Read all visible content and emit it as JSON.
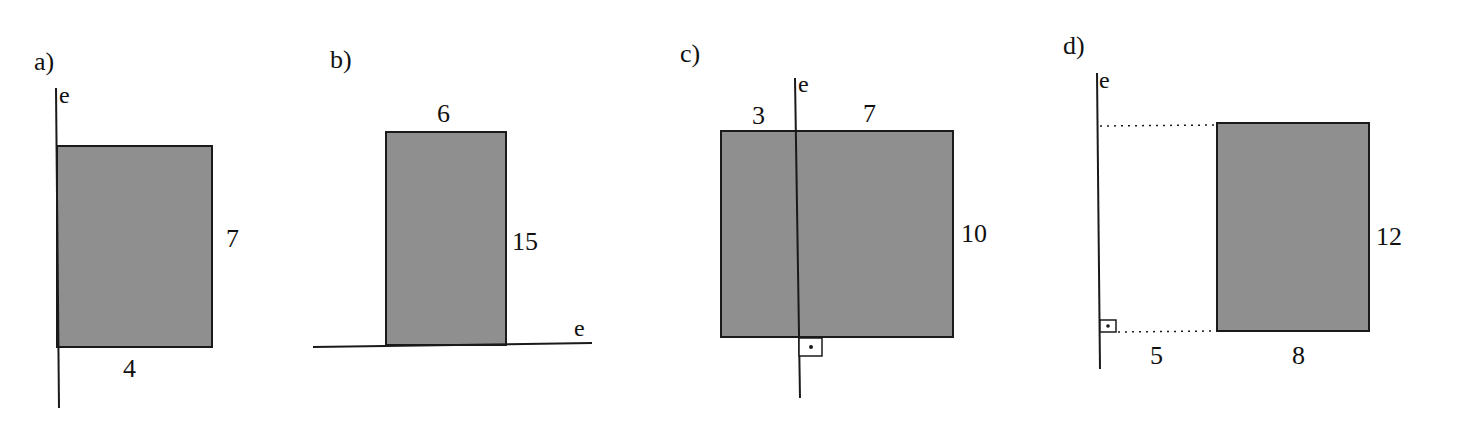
{
  "colors": {
    "fill": "#8f8f8f",
    "stroke": "#1a1a1a",
    "background": "#ffffff"
  },
  "figures": [
    {
      "id": "a",
      "label": "a)",
      "axis_label": "e",
      "width_label": "4",
      "height_label": "7"
    },
    {
      "id": "b",
      "label": "b)",
      "axis_label": "e",
      "width_label": "6",
      "height_label": "15"
    },
    {
      "id": "c",
      "label": "c)",
      "axis_label": "e",
      "left_width_label": "3",
      "right_width_label": "7",
      "height_label": "10"
    },
    {
      "id": "d",
      "label": "d)",
      "axis_label": "e",
      "distance_label": "5",
      "width_label": "8",
      "height_label": "12"
    }
  ]
}
